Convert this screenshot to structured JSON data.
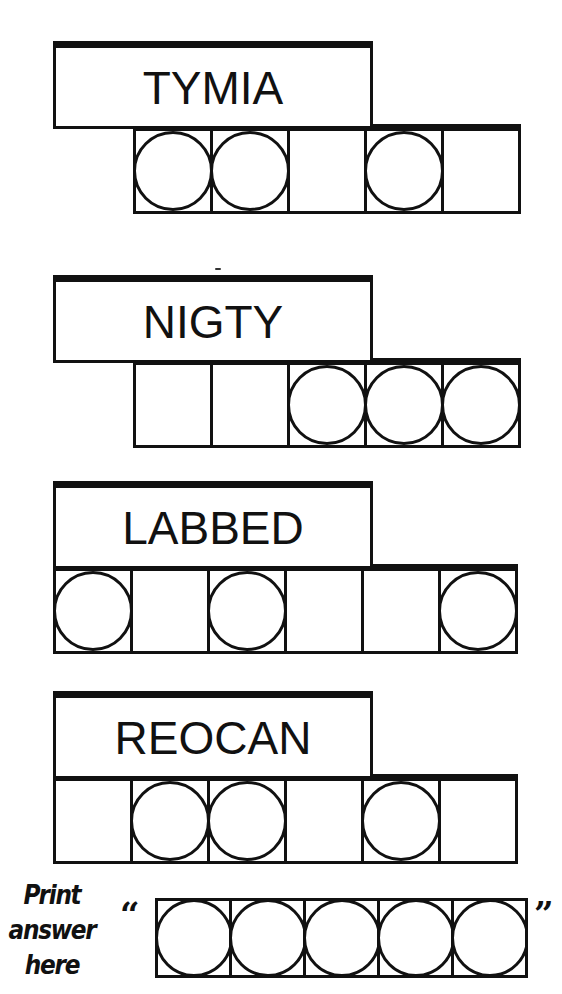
{
  "game": "Jumble word puzzle",
  "puzzles": [
    {
      "scrambled": "TYMIA",
      "letter_count": 5,
      "cells_start_x": 133,
      "circled": [
        true,
        true,
        false,
        true,
        false
      ]
    },
    {
      "scrambled": "NIGTY",
      "letter_count": 5,
      "cells_start_x": 133,
      "circled": [
        false,
        false,
        true,
        true,
        true
      ]
    },
    {
      "scrambled": "LABBED",
      "letter_count": 6,
      "cells_start_x": 53,
      "circled": [
        true,
        false,
        true,
        false,
        false,
        true
      ]
    },
    {
      "scrambled": "REOCAN",
      "letter_count": 6,
      "cells_start_x": 53,
      "circled": [
        false,
        true,
        true,
        false,
        true,
        false
      ]
    }
  ],
  "answer": {
    "prompt_lines": [
      "Print",
      "answer",
      "here"
    ],
    "open_quote": "“",
    "close_quote": "”",
    "letter_count": 5,
    "circled": [
      true,
      true,
      true,
      true,
      true
    ]
  },
  "colors": {
    "ink": "#111111",
    "background": "#ffffff"
  }
}
